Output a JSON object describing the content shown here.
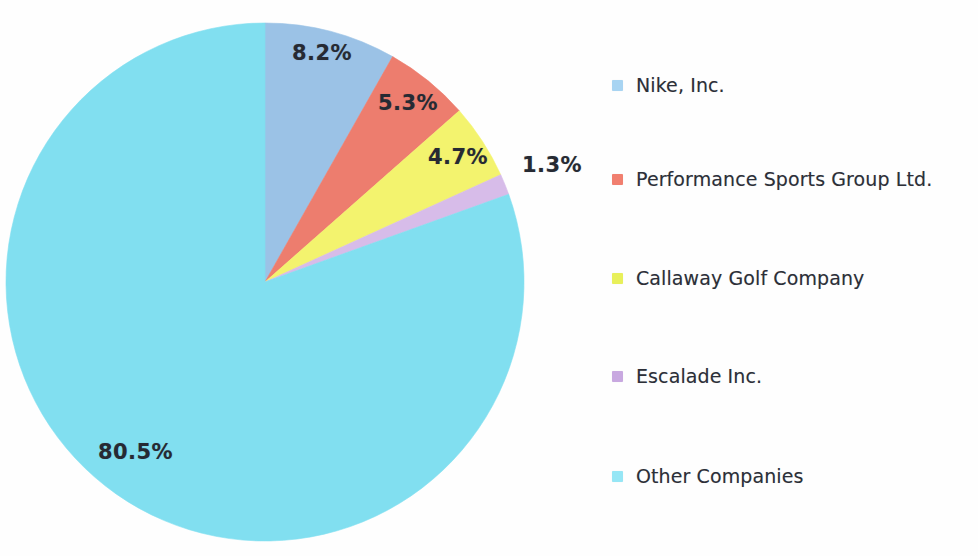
{
  "chart_data": {
    "type": "pie",
    "title": "",
    "subtitle": "",
    "xlabel": "",
    "ylabel": "",
    "legend_position": "right",
    "grid": false,
    "start_angle_deg": 0,
    "direction": "clockwise",
    "categories": [
      "Nike, Inc.",
      "Performance Sports Group Ltd.",
      "Callaway Golf Company",
      "Escalade Inc.",
      "Other Companies"
    ],
    "values": [
      8.2,
      5.3,
      4.7,
      1.3,
      80.5
    ],
    "labels": [
      "8.2%",
      "5.3%",
      "4.7%",
      "1.3%",
      "80.5%"
    ],
    "colors": [
      "#9BC2E6",
      "#ED7D6E",
      "#F3F36E",
      "#D7BCE9",
      "#81DFF0"
    ],
    "units": "percent",
    "slices": [
      {
        "name": "Nike, Inc.",
        "value": 8.2,
        "label": "8.2%",
        "color": "#9BC2E6"
      },
      {
        "name": "Performance Sports Group Ltd.",
        "value": 5.3,
        "label": "5.3%",
        "color": "#ED7D6E"
      },
      {
        "name": "Callaway Golf Company",
        "value": 4.7,
        "label": "4.7%",
        "color": "#F3F36E"
      },
      {
        "name": "Escalade Inc.",
        "value": 1.3,
        "label": "1.3%",
        "color": "#D7BCE9"
      },
      {
        "name": "Other Companies",
        "value": 80.5,
        "label": "80.5%",
        "color": "#81DFF0"
      }
    ]
  },
  "pie": {
    "labels": {
      "nike": "8.2%",
      "performance": "5.3%",
      "callaway": "4.7%",
      "escalade": "1.3%",
      "other": "80.5%"
    }
  },
  "legend": {
    "items": [
      {
        "label": "Nike, Inc.",
        "color": "#A8D4F2"
      },
      {
        "label": "Performance Sports Group Ltd.",
        "color": "#F17F6F"
      },
      {
        "label": "Callaway Golf Company",
        "color": "#E8F05A"
      },
      {
        "label": "Escalade Inc.",
        "color": "#C8A8E0"
      },
      {
        "label": "Other Companies",
        "color": "#96E6F5"
      }
    ]
  }
}
